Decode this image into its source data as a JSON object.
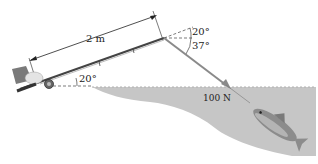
{
  "figure": {
    "rod_length_label": "2 m",
    "rod_angle_label": "20°",
    "tip_angle_upper_label": "20°",
    "tip_angle_lower_label": "37°",
    "force_label": "100 N"
  },
  "colors": {
    "water": "#c4c4c4",
    "line": "#8a8a8a",
    "rod": "#444444",
    "dimension": "#222222"
  }
}
